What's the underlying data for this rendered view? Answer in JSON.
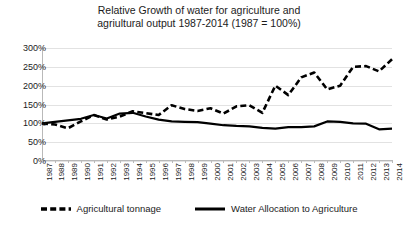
{
  "chart_data": {
    "type": "line",
    "title": "Relative Growth of water for agriculture and agriultural output 1987-2014 (1987 = 100%)",
    "title_line1": "Relative Growth of water for agriculture and",
    "title_line2": "agriultural output 1987-2014 (1987 = 100%)",
    "xlabel": "",
    "ylabel": "",
    "ylim": [
      0,
      300
    ],
    "ytick_labels": [
      "300%",
      "250%",
      "200%",
      "150%",
      "100%",
      "50%",
      "0%"
    ],
    "ytick_values": [
      300,
      250,
      200,
      150,
      100,
      50,
      0
    ],
    "grid": true,
    "legend_position": "bottom",
    "categories": [
      "1987",
      "1988",
      "1989",
      "1990",
      "1991",
      "1992",
      "1993",
      "1994",
      "1995",
      "1996",
      "1997",
      "1998",
      "1999",
      "2000",
      "2001",
      "2002",
      "2003",
      "2004",
      "2005",
      "2006",
      "2007",
      "2008",
      "2009",
      "2010",
      "2011",
      "2012",
      "2013",
      "2014"
    ],
    "series": [
      {
        "name": "Agricultural tonnage",
        "style": "dashed",
        "color": "#000000",
        "values": [
          100,
          97,
          87,
          105,
          122,
          110,
          118,
          132,
          127,
          122,
          148,
          138,
          133,
          140,
          126,
          145,
          148,
          128,
          200,
          175,
          222,
          235,
          190,
          200,
          250,
          252,
          238,
          270
        ]
      },
      {
        "name": "Water Allocation to Agriculture",
        "style": "solid",
        "color": "#000000",
        "values": [
          100,
          104,
          108,
          112,
          122,
          113,
          126,
          128,
          118,
          110,
          105,
          104,
          103,
          99,
          95,
          93,
          92,
          88,
          86,
          90,
          90,
          92,
          105,
          104,
          100,
          99,
          84,
          86
        ]
      }
    ]
  },
  "legend": {
    "items": [
      {
        "label": "Agricultural tonnage",
        "style": "dashed"
      },
      {
        "label": "Water Allocation to Agriculture",
        "style": "solid"
      }
    ]
  }
}
